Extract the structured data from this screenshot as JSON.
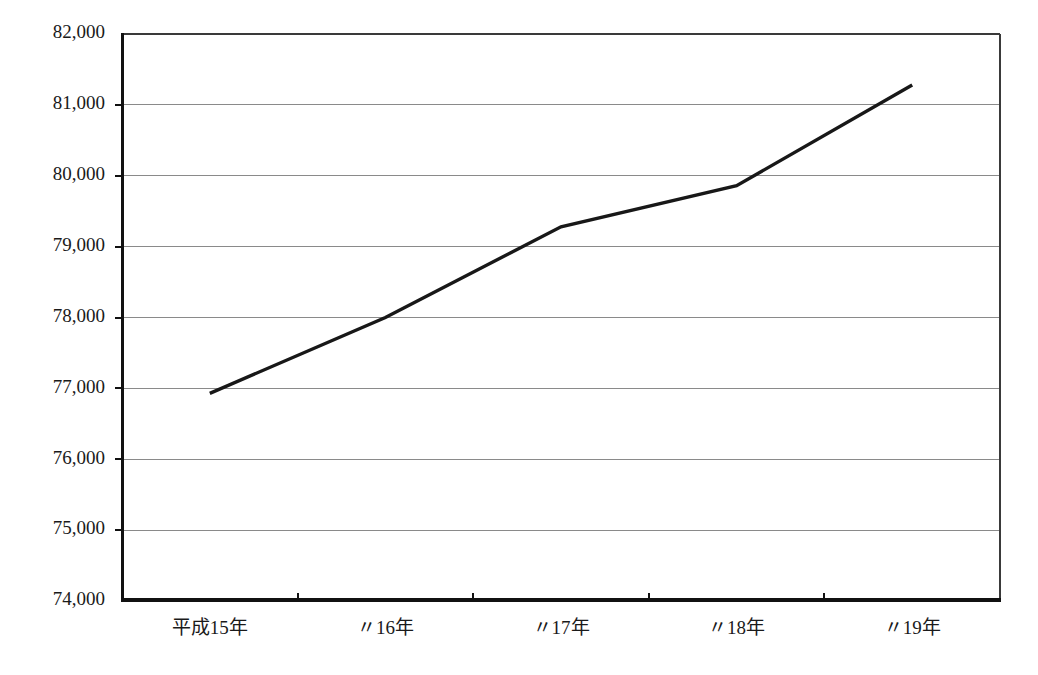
{
  "chart_data": {
    "type": "line",
    "title": "",
    "subtitle": "",
    "xlabel": "",
    "ylabel": "",
    "categories": [
      "平成15年",
      "〃16年",
      "〃17年",
      "〃18年",
      "〃19年"
    ],
    "series": [
      {
        "name": "",
        "values": [
          76930,
          78000,
          79280,
          79860,
          81280
        ]
      }
    ],
    "ylim": [
      74000,
      82000
    ],
    "ytick_values": [
      74000,
      75000,
      76000,
      77000,
      78000,
      79000,
      80000,
      81000,
      82000
    ],
    "ytick_labels": [
      "74,000",
      "75,000",
      "76,000",
      "77,000",
      "78,000",
      "79,000",
      "80,000",
      "81,000",
      "82,000"
    ],
    "grid": true,
    "grid_axis": "y",
    "legend": false,
    "legend_position": "none",
    "line_color": "#181818",
    "grid_color": "#8a8a8a",
    "axis_color": "#111111",
    "background_color": "#ffffff",
    "markers": false,
    "annotations": []
  },
  "plot_geometry": {
    "left": 122,
    "right": 1000,
    "top": 34,
    "bottom": 601
  }
}
